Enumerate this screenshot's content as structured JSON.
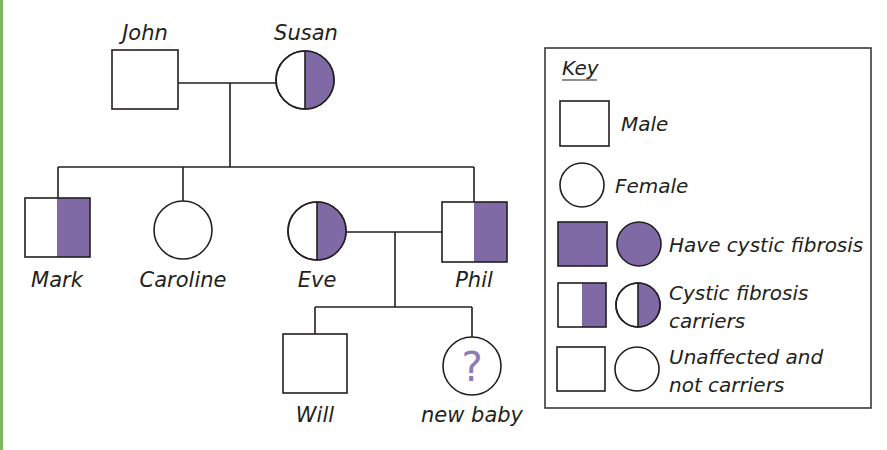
{
  "colors": {
    "affected": "#7f6aa5",
    "outline": "#231f20",
    "page_border": "#7cb95c",
    "question_mark": "#8a7bb8"
  },
  "pedigree": {
    "title": "Cystic fibrosis family pedigree",
    "generation1": {
      "father": {
        "name": "John",
        "sex": "male",
        "status": "unaffected"
      },
      "mother": {
        "name": "Susan",
        "sex": "female",
        "status": "carrier"
      }
    },
    "generation2": {
      "mark": {
        "name": "Mark",
        "sex": "male",
        "status": "carrier"
      },
      "caroline": {
        "name": "Caroline",
        "sex": "female",
        "status": "unaffected"
      },
      "eve": {
        "name": "Eve",
        "sex": "female",
        "status": "carrier",
        "note": "partner of Phil"
      },
      "phil": {
        "name": "Phil",
        "sex": "male",
        "status": "carrier"
      }
    },
    "generation3": {
      "will": {
        "name": "Will",
        "sex": "male",
        "status": "unaffected"
      },
      "baby": {
        "name": "new baby",
        "sex": "unknown",
        "status": "unknown",
        "symbol": "?"
      }
    }
  },
  "key": {
    "title": "Key",
    "male": "Male",
    "female": "Female",
    "affected": "Have cystic fibrosis",
    "carrier_line1": "Cystic fibrosis",
    "carrier_line2": "carriers",
    "unaffected_line1": "Unaffected and",
    "unaffected_line2": "not carriers"
  }
}
